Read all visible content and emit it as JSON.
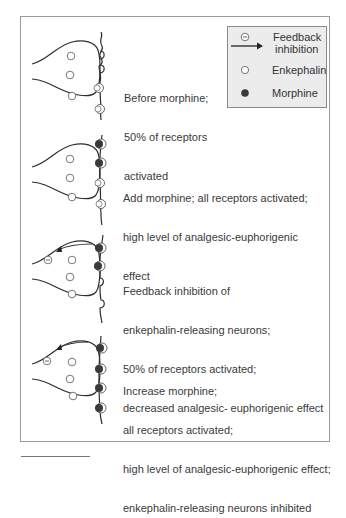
{
  "legend": {
    "items": [
      {
        "icon": "feedback-inhibition-arrow",
        "label_line1": "Feedback",
        "label_line2": "inhibition"
      },
      {
        "icon": "open-circle",
        "label": "Enkephalin"
      },
      {
        "icon": "filled-circle",
        "label": "Morphine"
      }
    ]
  },
  "panels": [
    {
      "id": "before-morphine",
      "lines": [
        "Before morphine;",
        "50% of receptors",
        "activated"
      ],
      "receptors": [
        "empty",
        "empty",
        "enkephalin",
        "enkephalin"
      ],
      "feedback_inhibition": false
    },
    {
      "id": "add-morphine",
      "lines": [
        "Add morphine; all receptors activated;",
        "high level of analgesic-euphorigenic",
        "effect"
      ],
      "receptors": [
        "morphine",
        "morphine",
        "enkephalin",
        "enkephalin"
      ],
      "feedback_inhibition": false
    },
    {
      "id": "feedback-inhibition",
      "lines": [
        "Feedback inhibition of",
        "enkephalin-releasing neurons;",
        "50% of receptors activated;",
        "decreased analgesic- euphorigenic effect"
      ],
      "receptors": [
        "morphine",
        "morphine",
        "empty",
        "empty"
      ],
      "feedback_inhibition": true
    },
    {
      "id": "increase-morphine",
      "lines": [
        "Increase morphine;",
        "all receptors activated;",
        "high level of analgesic-euphorigenic effect;",
        "enkephalin-releasing neurons inhibited"
      ],
      "receptors": [
        "morphine",
        "morphine",
        "morphine",
        "morphine"
      ],
      "feedback_inhibition": true
    }
  ],
  "colors": {
    "line": "#2e2e2e",
    "morphine": "#3a3a3a",
    "legend_bg": "#ececec",
    "frame": "#9a9a9a"
  }
}
